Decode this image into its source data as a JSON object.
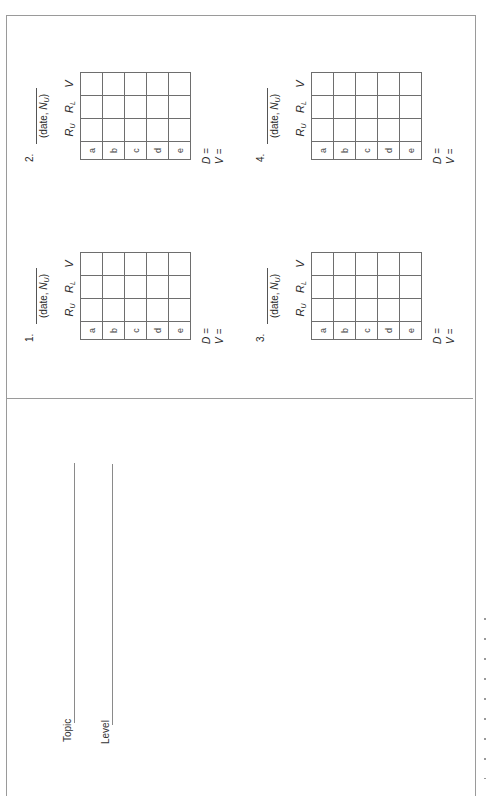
{
  "form": {
    "fields": [
      {
        "label": "Topic",
        "value": ""
      },
      {
        "label": "Level",
        "value": ""
      }
    ]
  },
  "blocks": [
    {
      "number": "1.",
      "date_caption": "(date, ",
      "n_symbol": "N",
      "n_sub": "U",
      "close": ")",
      "columns": [
        {
          "sym": "R",
          "sub": "U"
        },
        {
          "sym": "R",
          "sub": "L"
        },
        {
          "sym": "V",
          "sub": ""
        }
      ],
      "rows": [
        "a",
        "b",
        "c",
        "d",
        "e"
      ],
      "d_label": "D =",
      "v_label": "V ="
    },
    {
      "number": "2.",
      "date_caption": "(date, ",
      "n_symbol": "N",
      "n_sub": "U",
      "close": ")",
      "columns": [
        {
          "sym": "R",
          "sub": "U"
        },
        {
          "sym": "R",
          "sub": "L"
        },
        {
          "sym": "V",
          "sub": ""
        }
      ],
      "rows": [
        "a",
        "b",
        "c",
        "d",
        "e"
      ],
      "d_label": "D =",
      "v_label": "V ="
    },
    {
      "number": "3.",
      "date_caption": "(date, ",
      "n_symbol": "N",
      "n_sub": "U",
      "close": ")",
      "columns": [
        {
          "sym": "R",
          "sub": "U"
        },
        {
          "sym": "R",
          "sub": "L"
        },
        {
          "sym": "V",
          "sub": ""
        }
      ],
      "rows": [
        "a",
        "b",
        "c",
        "d",
        "e"
      ],
      "d_label": "D =",
      "v_label": "V ="
    },
    {
      "number": "4.",
      "date_caption": "(date, ",
      "n_symbol": "N",
      "n_sub": "U",
      "close": ")",
      "columns": [
        {
          "sym": "R",
          "sub": "U"
        },
        {
          "sym": "R",
          "sub": "L"
        },
        {
          "sym": "V",
          "sub": ""
        }
      ],
      "rows": [
        "a",
        "b",
        "c",
        "d",
        "e"
      ],
      "d_label": "D =",
      "v_label": "V ="
    }
  ]
}
